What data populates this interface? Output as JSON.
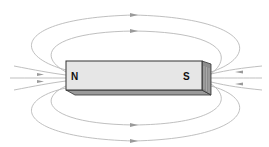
{
  "diagram": {
    "magnet": {
      "north_label": "N",
      "south_label": "S",
      "face_color": "#e6e6e6",
      "end_color": "#8c8c8c",
      "edge_color": "#333333"
    },
    "field_line_color": "#b8b8b8",
    "arrow_color": "#9a9a9a",
    "field_direction": "from N pole around to S pole"
  }
}
